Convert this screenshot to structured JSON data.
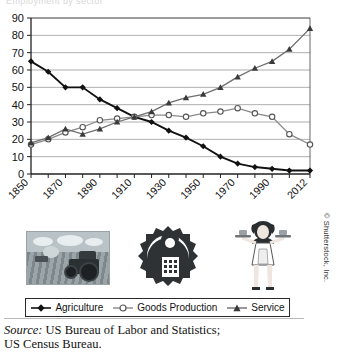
{
  "figure": {
    "cut_title": "Employment by sector",
    "source_label": "Source:",
    "source_text": "US Bureau of Labor and Statistics;",
    "source_text2": "US Census Bureau.",
    "credit": "© Shutterstock, Inc."
  },
  "images": [
    {
      "name": "agriculture-photo",
      "alt": "Tractor plowing a field"
    },
    {
      "name": "goods-production-emblem",
      "alt": "Factory inside a gear with worker"
    },
    {
      "name": "service-illustration",
      "alt": "Waitress holding two serving trays"
    }
  ],
  "legend": {
    "items": [
      {
        "label": "Agriculture",
        "marker": "filled-diamond",
        "color": "#111111"
      },
      {
        "label": "Goods Production",
        "marker": "open-circle",
        "color": "#8a8a8a"
      },
      {
        "label": "Service",
        "marker": "filled-triangle",
        "color": "#6e6e6e"
      }
    ]
  },
  "chart_data": {
    "type": "line",
    "title": "",
    "xlabel": "",
    "ylabel": "",
    "xlim": [
      1850,
      2012
    ],
    "ylim": [
      0,
      90
    ],
    "yticks": [
      0,
      10,
      20,
      30,
      40,
      50,
      60,
      70,
      80,
      90
    ],
    "xticks": [
      1850,
      1860,
      1870,
      1880,
      1890,
      1900,
      1910,
      1920,
      1930,
      1940,
      1950,
      1960,
      1970,
      1980,
      1990,
      2000,
      2012
    ],
    "xtick_labels": [
      "1850",
      "1870",
      "1890",
      "1910",
      "1930",
      "1950",
      "1970",
      "1990",
      "2012"
    ],
    "xtick_label_values": [
      1850,
      1870,
      1890,
      1910,
      1930,
      1950,
      1970,
      1990,
      2012
    ],
    "grid": "horizontal",
    "legend_position": "bottom",
    "x": [
      1850,
      1860,
      1870,
      1880,
      1890,
      1900,
      1910,
      1920,
      1930,
      1940,
      1950,
      1960,
      1970,
      1980,
      1990,
      2000,
      2012
    ],
    "series": [
      {
        "name": "Agriculture",
        "marker": "filled-diamond",
        "color": "#111111",
        "values": [
          65,
          59,
          50,
          50,
          43,
          38,
          33,
          30,
          25,
          21,
          16,
          10,
          6,
          4,
          3,
          2,
          2
        ]
      },
      {
        "name": "Goods Production",
        "marker": "open-circle",
        "color": "#8a8a8a",
        "values": [
          17,
          20,
          24,
          27,
          31,
          32,
          33,
          34,
          34,
          33,
          35,
          36,
          38,
          35,
          33,
          23,
          17
        ]
      },
      {
        "name": "Service",
        "marker": "filled-triangle",
        "color": "#6e6e6e",
        "values": [
          18,
          21,
          26,
          23,
          26,
          30,
          33,
          36,
          41,
          44,
          46,
          50,
          56,
          61,
          65,
          72,
          84
        ]
      }
    ]
  }
}
